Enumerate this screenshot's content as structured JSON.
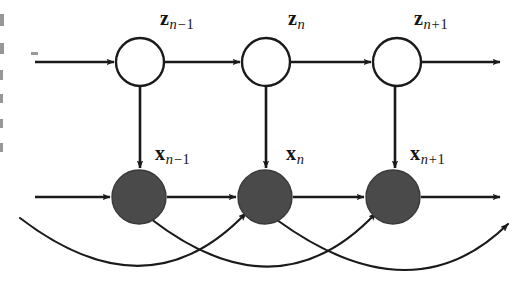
{
  "figure": {
    "kind": "probabilistic-graphical-model",
    "width": 527,
    "height": 294,
    "background_color": "#ffffff",
    "stroke_color": "#1a1a1a",
    "latent_node_fill": "#ffffff",
    "observed_node_fill": "#4a4a4a",
    "label_color": "#141414"
  },
  "latent_nodes": [
    {
      "id": "z-prev",
      "symbol": "z",
      "sub_op": "−",
      "sub_base": "n",
      "sub_num": "1",
      "cx": 140,
      "cy": 62,
      "r": 24,
      "label_left": 160,
      "label_top": 8
    },
    {
      "id": "z-curr",
      "symbol": "z",
      "sub_op": "",
      "sub_base": "n",
      "sub_num": "",
      "cx": 266,
      "cy": 62,
      "r": 24,
      "label_left": 288,
      "label_top": 8
    },
    {
      "id": "z-next",
      "symbol": "z",
      "sub_op": "+",
      "sub_base": "n",
      "sub_num": "1",
      "cx": 397,
      "cy": 62,
      "r": 24,
      "label_left": 414,
      "label_top": 8
    }
  ],
  "observed_nodes": [
    {
      "id": "x-prev",
      "symbol": "x",
      "sub_op": "−",
      "sub_base": "n",
      "sub_num": "1",
      "cx": 139,
      "cy": 197,
      "r": 27,
      "label_left": 155,
      "label_top": 143
    },
    {
      "id": "x-curr",
      "symbol": "x",
      "sub_op": "",
      "sub_base": "n",
      "sub_num": "",
      "cx": 265,
      "cy": 197,
      "r": 27,
      "label_left": 286,
      "label_top": 143
    },
    {
      "id": "x-next",
      "symbol": "x",
      "sub_op": "+",
      "sub_base": "n",
      "sub_num": "1",
      "cx": 393,
      "cy": 197,
      "r": 27,
      "label_left": 410,
      "label_top": 143
    }
  ],
  "edges": {
    "latent_chain": [
      {
        "id": "z-in",
        "from_x": 35,
        "to_x": 114,
        "y": 62,
        "arrow": true
      },
      {
        "id": "z-prev-to-z-curr",
        "from_x": 165,
        "to_x": 240,
        "y": 62,
        "arrow": true
      },
      {
        "id": "z-curr-to-z-next",
        "from_x": 291,
        "to_x": 371,
        "y": 62,
        "arrow": true
      },
      {
        "id": "z-out",
        "from_x": 422,
        "to_x": 500,
        "y": 62,
        "arrow": true
      }
    ],
    "observed_chain": [
      {
        "id": "x-in",
        "from_x": 35,
        "to_x": 110,
        "y": 197,
        "arrow": true
      },
      {
        "id": "x-prev-to-x-curr",
        "from_x": 167,
        "to_x": 236,
        "y": 197,
        "arrow": true
      },
      {
        "id": "x-curr-to-x-next",
        "from_x": 293,
        "to_x": 364,
        "y": 197,
        "arrow": true
      },
      {
        "id": "x-out",
        "from_x": 421,
        "to_x": 500,
        "y": 197,
        "arrow": true
      }
    ],
    "emissions": [
      {
        "id": "z-prev-to-x-prev",
        "x": 140,
        "from_y": 86,
        "to_y": 168,
        "arrow": true
      },
      {
        "id": "z-curr-to-x-curr",
        "x": 266,
        "from_y": 86,
        "to_y": 168,
        "arrow": true
      },
      {
        "id": "z-next-to-x-next",
        "x": 395,
        "from_y": 86,
        "to_y": 168,
        "arrow": true
      }
    ],
    "skip_arcs": [
      {
        "id": "arc-open-to-x-curr",
        "d": "M 20 218 Q 148 316 246 213",
        "arrow": true
      },
      {
        "id": "arc-x-prev-to-x-next",
        "d": "M 151 219 Q 278 317 376 213",
        "arrow": true
      },
      {
        "id": "arc-x-curr-to-out",
        "d": "M 277 220 Q 412 318 508 224",
        "arrow": true
      }
    ]
  },
  "scan_artifacts": [
    {
      "x": 0,
      "y": 14,
      "w": 4,
      "h": 12
    },
    {
      "x": 0,
      "y": 43,
      "w": 4,
      "h": 11
    },
    {
      "x": 0,
      "y": 70,
      "w": 3,
      "h": 10
    },
    {
      "x": 0,
      "y": 94,
      "w": 3,
      "h": 9
    },
    {
      "x": 0,
      "y": 119,
      "w": 3,
      "h": 9
    },
    {
      "x": 0,
      "y": 143,
      "w": 3,
      "h": 9
    },
    {
      "x": 31,
      "y": 52,
      "w": 7,
      "h": 3
    }
  ]
}
